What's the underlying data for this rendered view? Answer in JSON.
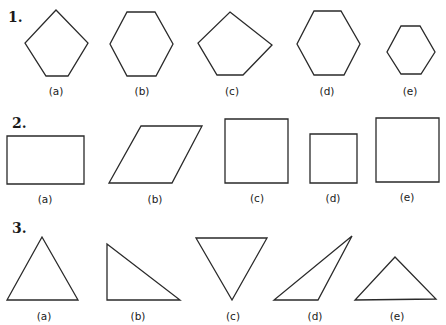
{
  "rows": [
    {
      "number": "1.",
      "number_pos": [
        8,
        22
      ],
      "figures": [
        {
          "label": "(a)",
          "shape": "pentagon",
          "points": "56,10 88,43 68,76 46,76 25,43",
          "label_pos": [
            56,
            95
          ]
        },
        {
          "label": "(b)",
          "shape": "hexagon",
          "points": "127,12 155,12 173,44 156,76 127,76 110,44",
          "label_pos": [
            142,
            95
          ]
        },
        {
          "label": "(c)",
          "shape": "irregular-pentagon",
          "points": "230,12 272,45 243,75 217,75 198,43",
          "label_pos": [
            232,
            95
          ]
        },
        {
          "label": "(d)",
          "shape": "hexagon",
          "points": "314,11 341,11 360,44 344,75 314,75 297,44",
          "label_pos": [
            327,
            95
          ]
        },
        {
          "label": "(e)",
          "shape": "small-hexagon",
          "points": "401,26 420,26 435,52 421,74 401,74 387,52",
          "label_pos": [
            410,
            95
          ]
        }
      ]
    },
    {
      "number": "2.",
      "number_pos": [
        12,
        128
      ],
      "figures": [
        {
          "label": "(a)",
          "shape": "rectangle",
          "points": "7,136 84,136 84,184 7,184",
          "label_pos": [
            45,
            203
          ]
        },
        {
          "label": "(b)",
          "shape": "parallelogram",
          "points": "141,126 202,126 172,183 109,183",
          "label_pos": [
            155,
            203
          ]
        },
        {
          "label": "(c)",
          "shape": "square",
          "points": "225,119 288,119 288,183 225,183",
          "label_pos": [
            257,
            202
          ]
        },
        {
          "label": "(d)",
          "shape": "small-square",
          "points": "310,134 357,134 357,183 310,183",
          "label_pos": [
            333,
            202
          ]
        },
        {
          "label": "(e)",
          "shape": "square",
          "points": "376,118 439,118 439,182 376,182",
          "label_pos": [
            407,
            201
          ]
        }
      ]
    },
    {
      "number": "3.",
      "number_pos": [
        12,
        233
      ],
      "figures": [
        {
          "label": "(a)",
          "shape": "equilateral-triangle",
          "points": "42,237 78,300 7,300",
          "label_pos": [
            44,
            320
          ]
        },
        {
          "label": "(b)",
          "shape": "right-triangle",
          "points": "107,244 180,300 107,300",
          "label_pos": [
            138,
            320
          ]
        },
        {
          "label": "(c)",
          "shape": "inverted-triangle",
          "points": "196,238 267,238 232,300",
          "label_pos": [
            233,
            320
          ]
        },
        {
          "label": "(d)",
          "shape": "obtuse-triangle",
          "points": "352,236 318,300 274,300",
          "label_pos": [
            315,
            320
          ]
        },
        {
          "label": "(e)",
          "shape": "isosceles-triangle",
          "points": "395,257 436,299 355,300",
          "label_pos": [
            397,
            320
          ]
        }
      ]
    }
  ],
  "colors": {
    "stroke": "#2a2a2a",
    "text": "#1a1a1a",
    "background": "#ffffff"
  }
}
